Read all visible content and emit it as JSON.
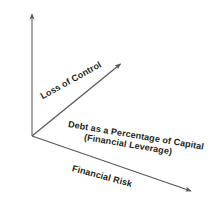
{
  "diagram": {
    "type": "risk-return-axes-diagram",
    "background_color": "#ffffff",
    "line_color": "#58595b",
    "text_color": "#231f20",
    "axes": {
      "vertical": {
        "label": "Profitability",
        "icon": "arrow-up-icon",
        "from": [
          32,
          136
        ],
        "to": [
          32,
          11
        ]
      },
      "diagonal_up": {
        "label": "Loss of Control",
        "icon": "arrow-up-right-icon",
        "from": [
          32,
          136
        ],
        "to": [
          123,
          62
        ]
      },
      "diagonal_down": {
        "label": "Financial Risk",
        "icon": "arrow-down-right-icon",
        "from": [
          32,
          136
        ],
        "to": [
          194,
          193
        ]
      }
    },
    "annotations": {
      "horizontal_axis_line1": "Debt as a Percentage of Capital",
      "horizontal_axis_line2": "(Financial Leverage)"
    }
  }
}
